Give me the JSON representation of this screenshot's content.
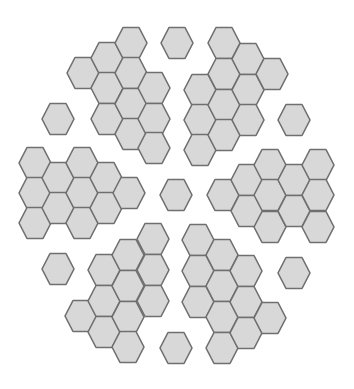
{
  "diagram": {
    "type": "hexagon-tiling",
    "orientation": "flat-top",
    "hex_size": {
      "half_width": 16,
      "half_height": 15.5,
      "top_edge_half": 8
    },
    "colors": {
      "fill": "#d8d8d8",
      "stroke": "#6f6f6f",
      "background": "#ffffff"
    },
    "groups": [
      {
        "name": "top-left-cluster",
        "hexes": [
          [
            83,
            73
          ],
          [
            107,
            58
          ],
          [
            107,
            88
          ],
          [
            107,
            119
          ],
          [
            131,
            43
          ],
          [
            131,
            73
          ],
          [
            131,
            104
          ],
          [
            131,
            134
          ],
          [
            154,
            88
          ],
          [
            154,
            119
          ],
          [
            154,
            148
          ]
        ]
      },
      {
        "name": "top-center-single",
        "hexes": [
          [
            177,
            43
          ]
        ]
      },
      {
        "name": "top-right-cluster",
        "hexes": [
          [
            200,
            90
          ],
          [
            200,
            120
          ],
          [
            200,
            150
          ],
          [
            224,
            43
          ],
          [
            224,
            74
          ],
          [
            224,
            105
          ],
          [
            224,
            135
          ],
          [
            248,
            59
          ],
          [
            248,
            90
          ],
          [
            248,
            120
          ],
          [
            272,
            74
          ]
        ]
      },
      {
        "name": "upper-left-single",
        "hexes": [
          [
            58,
            119
          ]
        ]
      },
      {
        "name": "upper-right-single",
        "hexes": [
          [
            294,
            120
          ]
        ]
      },
      {
        "name": "left-cluster",
        "hexes": [
          [
            35,
            163
          ],
          [
            35,
            193
          ],
          [
            35,
            223
          ],
          [
            58,
            178
          ],
          [
            58,
            208
          ],
          [
            82,
            163
          ],
          [
            82,
            193
          ],
          [
            82,
            223
          ],
          [
            106,
            178
          ],
          [
            106,
            208
          ],
          [
            129,
            193
          ]
        ]
      },
      {
        "name": "center-single",
        "hexes": [
          [
            176,
            195
          ]
        ]
      },
      {
        "name": "right-cluster",
        "hexes": [
          [
            223,
            195
          ],
          [
            247,
            180
          ],
          [
            247,
            211
          ],
          [
            270,
            165
          ],
          [
            270,
            195
          ],
          [
            270,
            227
          ],
          [
            294,
            180
          ],
          [
            294,
            211
          ],
          [
            318,
            165
          ],
          [
            318,
            195
          ],
          [
            318,
            227
          ]
        ]
      },
      {
        "name": "lower-left-single",
        "hexes": [
          [
            58,
            269
          ]
        ]
      },
      {
        "name": "lower-right-single",
        "hexes": [
          [
            294,
            273
          ]
        ]
      },
      {
        "name": "bottom-left-cluster",
        "hexes": [
          [
            81,
            316
          ],
          [
            104,
            270
          ],
          [
            104,
            301
          ],
          [
            104,
            332
          ],
          [
            128,
            255
          ],
          [
            128,
            286
          ],
          [
            128,
            317
          ],
          [
            128,
            347
          ],
          [
            153,
            239
          ],
          [
            153,
            270
          ],
          [
            153,
            301
          ]
        ]
      },
      {
        "name": "bottom-right-cluster",
        "hexes": [
          [
            198,
            240
          ],
          [
            198,
            271
          ],
          [
            198,
            302
          ],
          [
            222,
            255
          ],
          [
            222,
            286
          ],
          [
            222,
            317
          ],
          [
            222,
            348
          ],
          [
            246,
            271
          ],
          [
            246,
            302
          ],
          [
            246,
            333
          ],
          [
            270,
            318
          ]
        ]
      },
      {
        "name": "bottom-center-single",
        "hexes": [
          [
            176,
            348
          ]
        ]
      }
    ]
  }
}
